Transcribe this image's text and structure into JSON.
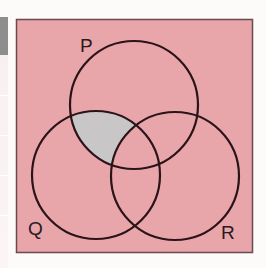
{
  "diagram": {
    "type": "venn",
    "sets": [
      {
        "name": "P",
        "label": "P",
        "cx": 134,
        "cy": 105,
        "r": 64
      },
      {
        "name": "Q",
        "label": "Q",
        "cx": 96,
        "cy": 175,
        "r": 64
      },
      {
        "name": "R",
        "label": "R",
        "cx": 175,
        "cy": 176,
        "r": 64
      }
    ],
    "shaded_region": "P ∩ Q ∩ R'",
    "colors": {
      "universe_fill": "#e8a5aa",
      "universe_border": "#6b4a4e",
      "circle_stroke": "#2a1418",
      "shaded_fill": "#c9c6c8",
      "label_color": "#2a1a1e"
    }
  },
  "labels": {
    "P": "P",
    "Q": "Q",
    "R": "R"
  }
}
